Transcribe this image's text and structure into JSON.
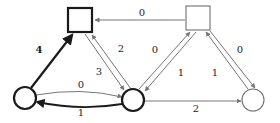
{
  "figure": {
    "kind": "directed-weighted-graph",
    "background_color": "#ffffff",
    "default_edge_color": "#767676",
    "highlight_edge_color": "#1a1a1a",
    "node_stroke_color": "#1a1a1a",
    "node_light_stroke_color": "#6f6f6f",
    "node_fill_color": "#ffffff"
  },
  "nodes": [
    {
      "id": "square-top-left",
      "shape": "square",
      "label": "",
      "cx": 80,
      "cy": 20,
      "size": 24,
      "emphasis": "bold"
    },
    {
      "id": "square-top-right",
      "shape": "square",
      "label": "",
      "cx": 198,
      "cy": 18,
      "size": 24,
      "emphasis": "light"
    },
    {
      "id": "circle-bottom-left",
      "shape": "circle",
      "label": "",
      "cx": 25,
      "cy": 98,
      "size": 22,
      "emphasis": "bold"
    },
    {
      "id": "circle-bottom-mid",
      "shape": "circle",
      "label": "",
      "cx": 133,
      "cy": 100,
      "size": 22,
      "emphasis": "bold"
    },
    {
      "id": "circle-bottom-right",
      "shape": "circle",
      "label": "",
      "cx": 253,
      "cy": 100,
      "size": 22,
      "emphasis": "light"
    }
  ],
  "edges": [
    {
      "id": "e-sqr-to-sql",
      "from": "square-top-right",
      "to": "square-top-left",
      "weight": "0",
      "label_x": 142,
      "label_y": 13,
      "emphasis": "light"
    },
    {
      "id": "e-cbl-to-sql",
      "from": "circle-bottom-left",
      "to": "square-top-left",
      "weight": "4",
      "label_x": 39,
      "label_y": 50,
      "emphasis": "bold"
    },
    {
      "id": "e-cbm-to-sql",
      "from": "circle-bottom-mid",
      "to": "square-top-left",
      "weight": "2",
      "label_x": 121,
      "label_y": 49,
      "emphasis": "light"
    },
    {
      "id": "e-sql-to-cbm",
      "from": "square-top-left",
      "to": "circle-bottom-mid",
      "weight": "3",
      "label_x": 99,
      "label_y": 72,
      "emphasis": "light"
    },
    {
      "id": "e-cbm-to-sqr",
      "from": "circle-bottom-mid",
      "to": "square-top-right",
      "weight": "0",
      "label_x": 155,
      "label_y": 50,
      "emphasis": "light"
    },
    {
      "id": "e-sqr-to-cbm",
      "from": "square-top-right",
      "to": "circle-bottom-mid",
      "weight": "1",
      "label_x": 181,
      "label_y": 73,
      "emphasis": "light"
    },
    {
      "id": "e-cbr-to-sqr",
      "from": "circle-bottom-right",
      "to": "square-top-right",
      "weight": "1",
      "label_x": 215,
      "label_y": 73,
      "emphasis": "light"
    },
    {
      "id": "e-sqr-to-cbr",
      "from": "square-top-right",
      "to": "circle-bottom-right",
      "weight": "0",
      "label_x": 240,
      "label_y": 50,
      "emphasis": "light"
    },
    {
      "id": "e-cbl-to-cbm",
      "from": "circle-bottom-left",
      "to": "circle-bottom-mid",
      "weight": "0",
      "label_x": 81,
      "label_y": 85,
      "emphasis": "light"
    },
    {
      "id": "e-cbm-to-cbl",
      "from": "circle-bottom-mid",
      "to": "circle-bottom-left",
      "weight": "1",
      "label_x": 81,
      "label_y": 113,
      "emphasis": "bold"
    },
    {
      "id": "e-cbm-to-cbr",
      "from": "circle-bottom-mid",
      "to": "circle-bottom-right",
      "weight": "2",
      "label_x": 196,
      "label_y": 109,
      "emphasis": "light"
    }
  ]
}
